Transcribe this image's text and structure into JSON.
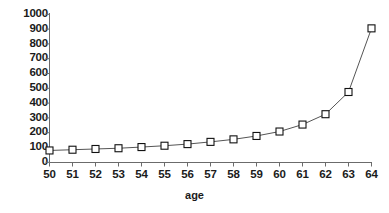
{
  "chart_data": {
    "type": "line",
    "title": "",
    "subtitle": "",
    "xlabel": "age",
    "ylabel": "",
    "x": [
      50,
      51,
      52,
      53,
      54,
      55,
      56,
      57,
      58,
      59,
      60,
      61,
      62,
      63,
      64
    ],
    "categories": [
      "50",
      "51",
      "52",
      "53",
      "54",
      "55",
      "56",
      "57",
      "58",
      "59",
      "60",
      "61",
      "62",
      "63",
      "64"
    ],
    "series": [
      {
        "name": "",
        "values": [
          80,
          85,
          90,
          95,
          103,
          112,
          123,
          138,
          155,
          178,
          208,
          255,
          325,
          475,
          905
        ],
        "marker": "open-square",
        "line_color": "#555555",
        "marker_edge_color": "#111111",
        "marker_face_color": "#ffffff"
      }
    ],
    "xlim": [
      50,
      64
    ],
    "ylim": [
      0,
      1000
    ],
    "ytick_values": [
      0,
      100,
      200,
      300,
      400,
      500,
      600,
      700,
      800,
      900,
      1000
    ],
    "ytick_labels": [
      "0",
      "100",
      "200",
      "300",
      "400",
      "500",
      "600",
      "700",
      "800",
      "900",
      "1000"
    ],
    "xtick_labels": [
      "50",
      "51",
      "52",
      "53",
      "54",
      "55",
      "56",
      "57",
      "58",
      "59",
      "60",
      "61",
      "62",
      "63",
      "64"
    ],
    "grid": false,
    "legend": null,
    "legend_position": "none",
    "axis_color": "#6b6b6b",
    "background_color": "#ffffff",
    "text_color": "#1b1b1b"
  }
}
